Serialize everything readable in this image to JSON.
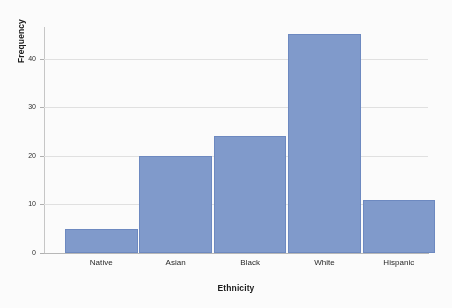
{
  "chart_data": {
    "type": "bar",
    "title": "",
    "subtitle": "",
    "xlabel": "Ethnicity",
    "ylabel": "Frequency",
    "categories": [
      "Native",
      "Asian",
      "Black",
      "White",
      "Hispanic"
    ],
    "values": [
      5,
      20,
      24,
      45,
      11
    ],
    "series": [
      {
        "name": "Frequency",
        "values": [
          5,
          20,
          24,
          45,
          11
        ]
      }
    ],
    "ylim": [
      0,
      46.5
    ],
    "xlim_categories": 5,
    "y_ticks": [
      0,
      10,
      20,
      30,
      40
    ],
    "y_tick_labels": [
      "0",
      "10",
      "20",
      "30",
      "40"
    ],
    "grid": "horizontal",
    "legend": "none",
    "annotations": [],
    "colors": {
      "bar_fill": "#7f9bd0",
      "bar_stroke": "#6b89c4",
      "gridline": "#e3e3e3",
      "axis": "#c8c8c8",
      "text": "#1a1a1a",
      "background": "#ffffff"
    }
  }
}
